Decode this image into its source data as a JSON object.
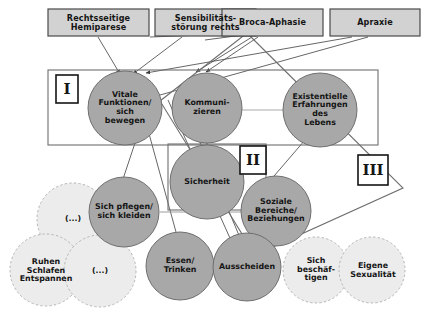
{
  "diagram": {
    "title_hidden": "",
    "colors": {
      "top_box_fill": "#d2d2d2",
      "top_box_border": "#4a4a4a",
      "dark_circle_fill": "#a8a8a8",
      "dark_circle_border": "#6f6f6f",
      "light_circle_fill": "#ececec",
      "light_circle_border": "#b4b4b4",
      "frame_border": "#6e6e6e",
      "line": "#4a4a4a",
      "text": "#151515",
      "background": "#ffffff"
    },
    "top_boxes": [
      {
        "label": "Rechtsseitige\nHemiparese"
      },
      {
        "label": "Sensibilitäts-\nstörung rechts"
      },
      {
        "label": "Broca-Aphasie"
      },
      {
        "label": "Apraxie"
      }
    ],
    "dark_circles": [
      {
        "label": "Vitale\nFunktionen/\nsich\nbewegen"
      },
      {
        "label": "Kommuni-\nzieren"
      },
      {
        "label": "Existentielle\nErfahrungen\ndes\nLebens"
      },
      {
        "label": "Sicherheit"
      },
      {
        "label": "Sich pflegen/\nsich kleiden"
      },
      {
        "label": "Soziale\nBereiche/\nBeziehungen"
      },
      {
        "label": "Essen/\nTrinken"
      },
      {
        "label": "Ausscheiden"
      }
    ],
    "light_circles": [
      {
        "label": "(...)"
      },
      {
        "label": "Ruhen\nSchlafen\nEntspannen"
      },
      {
        "label": "(...)"
      },
      {
        "label": "Sich\nbeschäf-\ntigen"
      },
      {
        "label": "Eigene\nSexualität"
      }
    ],
    "region_labels": [
      {
        "label": "I"
      },
      {
        "label": "II"
      },
      {
        "label": "III"
      }
    ]
  }
}
